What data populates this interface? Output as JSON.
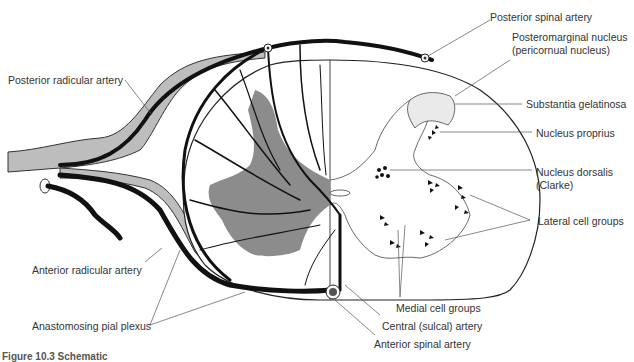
{
  "figure": {
    "caption": "Figure 10.3  Schematic",
    "colors": {
      "vessel": "#111111",
      "grey_matter": "#8c8c8c",
      "root": "#bdbdbd",
      "outline": "#222222",
      "leader": "#555555"
    }
  },
  "labels": {
    "posterior_spinal_artery": "Posterior spinal artery",
    "posteromarginal_1": "Posteromarginal nucleus",
    "posteromarginal_2": "(pericornual nucleus)",
    "substantia_gelatinosa": "Substantia gelatinosa",
    "nucleus_proprius": "Nucleus proprius",
    "nucleus_dorsalis_1": "Nucleus dorsalis",
    "nucleus_dorsalis_2": "(Clarke)",
    "lateral_cell_groups": "Lateral cell groups",
    "medial_cell_groups": "Medial cell groups",
    "central_sulcal_artery": "Central (sulcal) artery",
    "anterior_spinal_artery": "Anterior spinal artery",
    "posterior_radicular_artery": "Posterior radicular artery",
    "anterior_radicular_artery": "Anterior radicular artery",
    "anastomosing_pial_plexus": "Anastomosing pial plexus"
  }
}
